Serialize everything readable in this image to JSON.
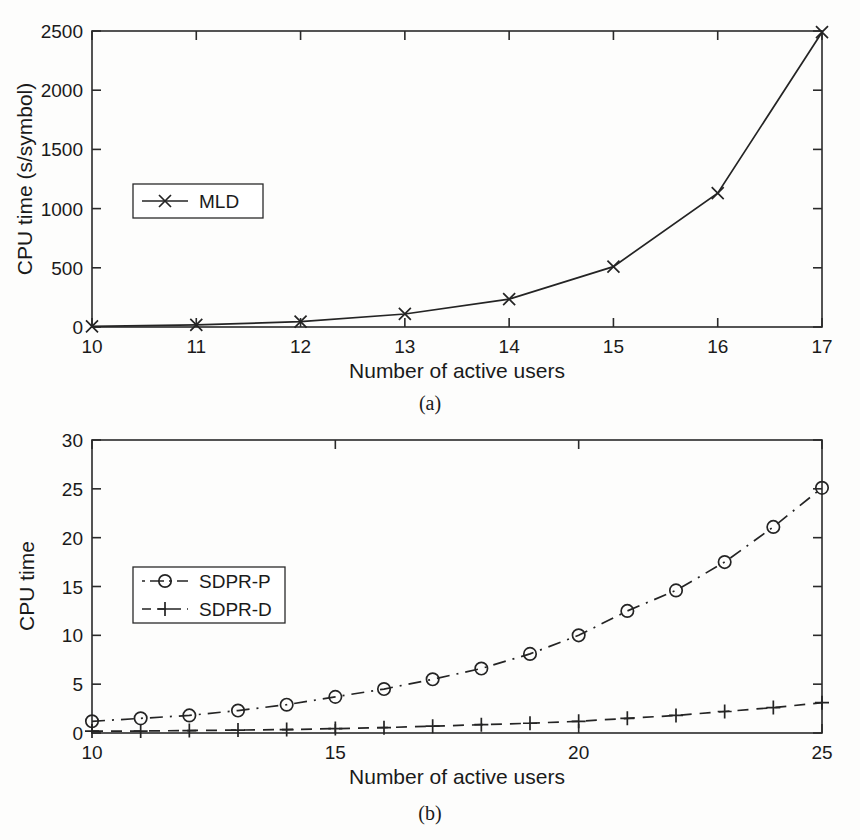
{
  "figure": {
    "background_color": "#fdfdfc",
    "line_color": "#242424",
    "text_color": "#1a1a1a"
  },
  "panels": [
    {
      "id": "a",
      "caption": "(a)",
      "chart_data": {
        "type": "line",
        "title": "",
        "xlabel": "Number of active users",
        "ylabel": "CPU time  (s/symbol)",
        "xlim": [
          10,
          17
        ],
        "ylim": [
          0,
          2500
        ],
        "xticks": [
          10,
          11,
          12,
          13,
          14,
          15,
          16,
          17
        ],
        "xticklabels": [
          "10",
          "11",
          "12",
          "13",
          "14",
          "15",
          "16",
          "17"
        ],
        "yticks": [
          0,
          500,
          1000,
          1500,
          2000,
          2500
        ],
        "yticklabels": [
          "0",
          "500",
          "1000",
          "1500",
          "2000",
          "2500"
        ],
        "grid": false,
        "legend_position": "center-left",
        "x": [
          10,
          11,
          12,
          13,
          14,
          15,
          16,
          17
        ],
        "series": [
          {
            "name": "MLD",
            "values": [
              5,
              18,
              45,
              110,
              235,
              510,
              1130,
              2490
            ],
            "linestyle": "solid",
            "marker": "x"
          }
        ]
      }
    },
    {
      "id": "b",
      "caption": "(b)",
      "chart_data": {
        "type": "line",
        "title": "",
        "xlabel": "Number of active users",
        "ylabel": "CPU time",
        "xlim": [
          10,
          25
        ],
        "ylim": [
          0,
          30
        ],
        "xticks": [
          10,
          15,
          20,
          25
        ],
        "xticklabels": [
          "10",
          "15",
          "20",
          "25"
        ],
        "yticks": [
          0,
          5,
          10,
          15,
          20,
          25,
          30
        ],
        "yticklabels": [
          "0",
          "5",
          "10",
          "15",
          "20",
          "25",
          "30"
        ],
        "grid": false,
        "legend_position": "center-left",
        "x": [
          10,
          11,
          12,
          13,
          14,
          15,
          16,
          17,
          18,
          19,
          20,
          21,
          22,
          23,
          24,
          25
        ],
        "series": [
          {
            "name": "SDPR-P",
            "values": [
              1.2,
              1.5,
              1.8,
              2.3,
              2.9,
              3.7,
              4.5,
              5.5,
              6.6,
              8.1,
              10.0,
              12.5,
              14.6,
              17.5,
              21.1,
              25.1
            ],
            "linestyle": "dashdot",
            "marker": "o"
          },
          {
            "name": "SDPR-D",
            "values": [
              0.2,
              0.2,
              0.25,
              0.3,
              0.35,
              0.45,
              0.55,
              0.7,
              0.85,
              1.0,
              1.2,
              1.5,
              1.8,
              2.2,
              2.6,
              3.1
            ],
            "linestyle": "dashed",
            "marker": "+"
          }
        ]
      }
    }
  ]
}
